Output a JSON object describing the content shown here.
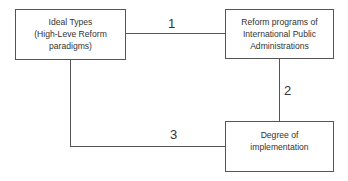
{
  "diagram": {
    "nodes": [
      {
        "id": "ideal-types",
        "lines": [
          "Ideal Types",
          "(High-Leve Reform",
          "paradigms)"
        ]
      },
      {
        "id": "reform-programs",
        "lines": [
          "Reform programs of",
          "International Public",
          "Administrations"
        ]
      },
      {
        "id": "degree-implementation",
        "lines": [
          "Degree of",
          "implementation"
        ]
      }
    ],
    "edges": [
      {
        "from": "ideal-types",
        "to": "reform-programs",
        "label": "1"
      },
      {
        "from": "reform-programs",
        "to": "degree-implementation",
        "label": "2"
      },
      {
        "from": "ideal-types",
        "to": "degree-implementation",
        "label": "3"
      }
    ]
  }
}
